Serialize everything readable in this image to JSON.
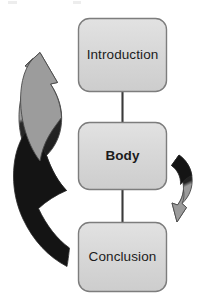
{
  "diagram": {
    "type": "flow-cycle",
    "background_color": "#ffffff",
    "nodes": [
      {
        "id": "introduction",
        "label": "Introduction",
        "emphasis": "regular",
        "fill_color": "#d8d8d8",
        "border_color": "#7d7d7d",
        "text_color": "#1c1c1c",
        "x": 78,
        "y": 18,
        "width": 89,
        "height": 74
      },
      {
        "id": "body",
        "label": "Body",
        "emphasis": "bold",
        "fill_color": "#d8d8d8",
        "border_color": "#7d7d7d",
        "text_color": "#1c1c1c",
        "x": 78,
        "y": 122,
        "width": 89,
        "height": 68
      },
      {
        "id": "conclusion",
        "label": "Conclusion",
        "emphasis": "regular",
        "fill_color": "#d8d8d8",
        "border_color": "#7d7d7d",
        "text_color": "#1c1c1c",
        "x": 78,
        "y": 222,
        "width": 89,
        "height": 70
      }
    ],
    "connectors": [
      {
        "id": "introduction-to-body",
        "from": "introduction",
        "to": "body",
        "style": "straight-line",
        "color": "#3a3a3a"
      },
      {
        "id": "body-to-conclusion",
        "from": "body",
        "to": "conclusion",
        "style": "straight-line",
        "color": "#3a3a3a"
      }
    ],
    "arrows": [
      {
        "id": "left-cycle-arrow",
        "shape": "large-curved-arc",
        "direction": "counter-clockwise-upward",
        "head_position": "top",
        "tail_color": "#1a1a1a",
        "head_color": "#9a9a9a",
        "outline_color": "#4a4a4a"
      },
      {
        "id": "right-cycle-arrow",
        "shape": "small-curved-arc",
        "direction": "clockwise-downward",
        "head_position": "bottom",
        "tail_color": "#1a1a1a",
        "head_color": "#9a9a9a",
        "outline_color": "#4a4a4a"
      }
    ],
    "artifacts": {
      "top_left_mark": "",
      "top_right_mark": ""
    }
  }
}
